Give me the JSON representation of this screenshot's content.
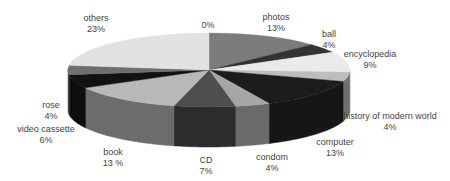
{
  "chart_data": {
    "type": "pie",
    "style": "3d",
    "title": "",
    "legend": "none",
    "unit": "%",
    "slices": [
      {
        "label": "0%",
        "name": "",
        "value": 0,
        "display": "0%",
        "top": "#d0d0d0",
        "side": "#a0a0a0",
        "lx": 208,
        "ly": 20
      },
      {
        "label": "photos",
        "name": "photos",
        "value": 13,
        "display": "13%",
        "top": "#7c7c7c",
        "side": "#5a5a5a",
        "lx": 276,
        "ly": 12
      },
      {
        "label": "ball",
        "name": "ball",
        "value": 4,
        "display": "4%",
        "top": "#333333",
        "side": "#222222",
        "lx": 329,
        "ly": 29
      },
      {
        "label": "encyclopedia",
        "name": "encyclopedia",
        "value": 9,
        "display": "9%",
        "top": "#eaeaea",
        "side": "#bcbcbc",
        "lx": 370,
        "ly": 49
      },
      {
        "label": "history of modern world",
        "name": "history of modern world",
        "value": 4,
        "display": "4%",
        "top": "#bdbdbd",
        "side": "#6e6e6e",
        "lx": 390,
        "ly": 111
      },
      {
        "label": "computer",
        "name": "computer",
        "value": 13,
        "display": "13%",
        "top": "#1c1c1c",
        "side": "#161616",
        "lx": 335,
        "ly": 137
      },
      {
        "label": "condom",
        "name": "condom",
        "value": 4,
        "display": "4%",
        "top": "#a6a6a6",
        "side": "#6a6a6a",
        "lx": 272,
        "ly": 152
      },
      {
        "label": "CD",
        "name": "CD",
        "value": 7,
        "display": "7%",
        "top": "#4e4e4e",
        "side": "#2c2c2c",
        "lx": 206,
        "ly": 155
      },
      {
        "label": "book",
        "name": "book",
        "value": 13,
        "display": "13 %",
        "top": "#b8b8b8",
        "side": "#6c6c6c",
        "lx": 113,
        "ly": 147
      },
      {
        "label": "video cassette",
        "name": "video cassette",
        "value": 6,
        "display": "6%",
        "top": "#121212",
        "side": "#0e0e0e",
        "lx": 46,
        "ly": 124
      },
      {
        "label": "rose",
        "name": "rose",
        "value": 4,
        "display": "4%",
        "top": "#6e6e6e",
        "side": "#4a4a4a",
        "lx": 51,
        "ly": 100
      },
      {
        "label": "others",
        "name": "others",
        "value": 23,
        "display": "23%",
        "top": "#e2e2e2",
        "side": "#9a9a9a",
        "lx": 96,
        "ly": 13
      }
    ],
    "geometry": {
      "cx": 209,
      "cy": 70,
      "rx": 141,
      "ry": 37,
      "depth": 40,
      "start_angle_deg": -90
    }
  }
}
